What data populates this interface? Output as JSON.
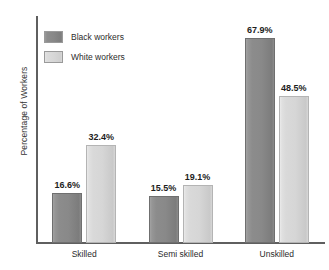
{
  "chart_data": {
    "type": "bar",
    "title": "",
    "xlabel": "",
    "ylabel": "Percentage of Workers",
    "categories": [
      "Skilled",
      "Semi skilled",
      "Unskilled"
    ],
    "series": [
      {
        "name": "Black workers",
        "color": "#8a8a8a",
        "values": [
          16.6,
          15.5,
          67.9
        ],
        "labels": [
          "16.6%",
          "15.5%",
          "67.9%"
        ]
      },
      {
        "name": "White workers",
        "color": "#d8d8d8",
        "values": [
          32.4,
          19.1,
          48.5
        ],
        "labels": [
          "32.4%",
          "19.1%",
          "48.5%"
        ]
      }
    ],
    "ylim": [
      0,
      75
    ],
    "grid": false,
    "y_tick_labels": [],
    "legend_position": "top-left",
    "units": "percent"
  },
  "legend": {
    "items": [
      {
        "label": "Black workers",
        "swatch": "dark-gray-swatch"
      },
      {
        "label": "White workers",
        "swatch": "light-gray-swatch"
      }
    ]
  },
  "axis": {
    "y_title": "Percentage of Workers"
  }
}
